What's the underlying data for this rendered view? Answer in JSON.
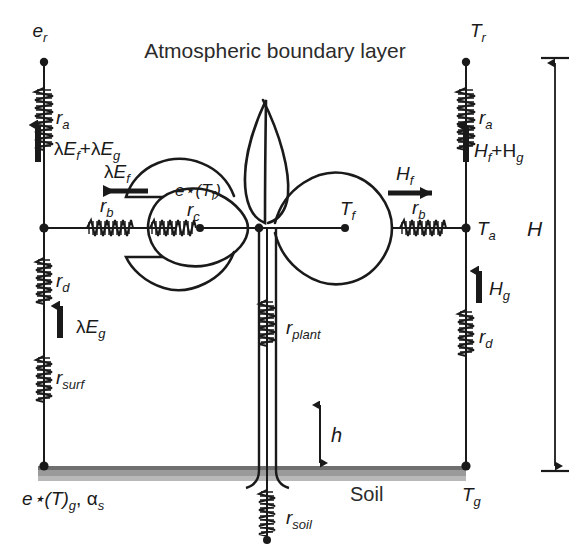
{
  "figure": {
    "title": "Atmospheric boundary layer",
    "soil_label": "Soil",
    "background_color": "#ffffff",
    "ink_color": "#1a1a1a",
    "soil_band_color": "#9a9a9a"
  },
  "left_column": {
    "description": "Vapour pressure / latent heat pathway",
    "top_node_label": "e",
    "top_node_sub": "r",
    "resistors": [
      {
        "name": "r",
        "sub": "a",
        "position": "above reference level"
      },
      {
        "name": "r",
        "sub": "b",
        "position": "horizontal canopy boundary layer"
      },
      {
        "name": "r",
        "sub": "d",
        "position": "below canopy air"
      },
      {
        "name": "r",
        "sub": "surf",
        "position": "soil surface"
      }
    ],
    "fluxes": [
      {
        "label": "λE",
        "sub": "f",
        "label2": "+λE",
        "sub2": "g",
        "direction": "up"
      },
      {
        "label": "λE",
        "sub": "f",
        "direction": "left"
      },
      {
        "label": "λE",
        "sub": "g",
        "direction": "up"
      }
    ],
    "ground_label_main": "e",
    "ground_label_star": "*",
    "ground_label_paren_open": "(T)",
    "ground_label_sub": "g",
    "ground_label_second": ", α",
    "ground_label_second_sub": "s"
  },
  "right_column": {
    "description": "Temperature / sensible heat pathway",
    "top_node_label": "T",
    "top_node_sub": "r",
    "resistors": [
      {
        "name": "r",
        "sub": "a",
        "position": "above reference level"
      },
      {
        "name": "r",
        "sub": "b",
        "position": "horizontal canopy boundary layer"
      },
      {
        "name": "r",
        "sub": "d",
        "position": "below canopy air"
      }
    ],
    "fluxes": [
      {
        "label": "H",
        "sub": "f",
        "label2": "+H",
        "sub2": "g",
        "direction": "up"
      },
      {
        "label": "H",
        "sub": "f",
        "direction": "right"
      },
      {
        "label": "H",
        "sub": "g",
        "direction": "up"
      }
    ],
    "air_node_label": "T",
    "air_node_sub": "a",
    "ground_node_label": "T",
    "ground_node_sub": "g"
  },
  "canopy": {
    "foliage_vapour_label": "e",
    "foliage_vapour_star": "*",
    "foliage_vapour_arg": "(T",
    "foliage_vapour_arg_sub": "f",
    "foliage_vapour_arg_close": ")",
    "stomatal_resistor": "r",
    "stomatal_resistor_sub": "c",
    "foliage_temp_label": "T",
    "foliage_temp_sub": "f",
    "plant_resistor": "r",
    "plant_resistor_sub": "plant",
    "soil_resistor": "r",
    "soil_resistor_sub": "soil"
  },
  "dimensions": {
    "canopy_height_label": "h",
    "reference_height_label": "H"
  }
}
